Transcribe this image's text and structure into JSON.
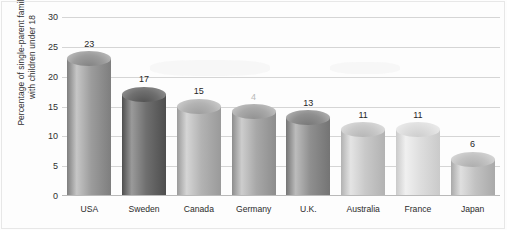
{
  "chart_data": {
    "type": "bar",
    "title": "",
    "subtitle": "",
    "xlabel": "",
    "ylabel": "Percentage of single-parent families with children under 18",
    "ylabel_lines": [
      "Percentage of single-parent families",
      "with children under 18"
    ],
    "categories": [
      "USA",
      "Sweden",
      "Canada",
      "Germany",
      "U.K.",
      "Australia",
      "France",
      "Japan"
    ],
    "values": [
      23,
      17,
      15,
      14,
      13,
      11,
      11,
      6
    ],
    "value_labels": [
      "23",
      "17",
      "15",
      "4",
      "13",
      "11",
      "11",
      "6"
    ],
    "ylim": [
      0,
      30
    ],
    "yticks": [
      0,
      5,
      10,
      15,
      20,
      25,
      30
    ],
    "ytick_labels": [
      "0",
      "5",
      "10",
      "15",
      "20",
      "25",
      "30"
    ],
    "grid": true,
    "legend": "none",
    "bar_style": "3d-cylinder",
    "bar_colors": [
      "#9c9c9c",
      "#6f6f6f",
      "#b3b3b3",
      "#a8a8a8",
      "#8f8f8f",
      "#c9c9c9",
      "#dedede",
      "#c2c2c2"
    ],
    "bar_colors_light": [
      "#c6c6c6",
      "#9a9a9a",
      "#d5d5d5",
      "#cdcdcd",
      "#bcbcbc",
      "#e4e4e4",
      "#f0f0f0",
      "#dfdfdf"
    ],
    "bar_colors_dark": [
      "#7e7e7e",
      "#4e4e4e",
      "#9a9a9a",
      "#8d8d8d",
      "#747474",
      "#b2b2b2",
      "#cacaca",
      "#a9a9a9"
    ],
    "grid_color": "#d5d5d5",
    "axis_color": "#b9b9b9",
    "background_color": "#fdfdfd",
    "text_color": "#2f2f2f"
  }
}
